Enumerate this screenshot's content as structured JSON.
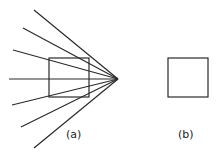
{
  "figure": {
    "panel_a": {
      "label": "(a)",
      "apex": [
        118,
        79
      ],
      "ray_starts": [
        [
          34,
          10
        ],
        [
          23,
          28
        ],
        [
          13,
          50
        ],
        [
          9,
          79
        ],
        [
          12,
          105
        ],
        [
          21,
          127
        ],
        [
          34,
          148
        ]
      ],
      "square": {
        "x": 49,
        "y": 58,
        "w": 40,
        "h": 39
      }
    },
    "panel_b": {
      "label": "(b)",
      "square": {
        "x": 168,
        "y": 58,
        "w": 40,
        "h": 39
      }
    },
    "stroke_color": "#2a2a2a"
  }
}
